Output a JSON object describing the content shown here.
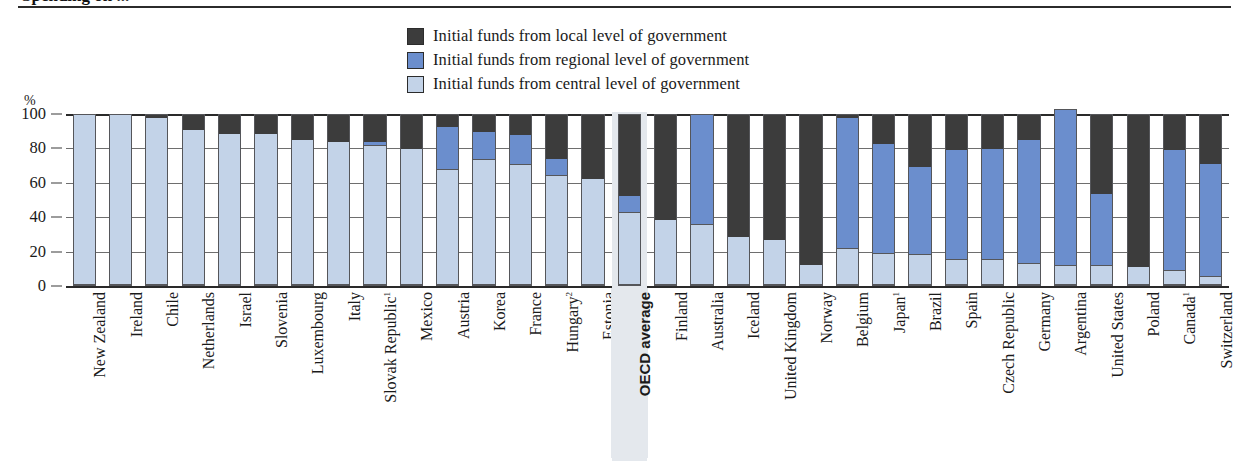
{
  "title_partial": "Spending on ...",
  "axis": {
    "y_unit": "%",
    "yticks": [
      0,
      20,
      40,
      60,
      80,
      100
    ],
    "ylim": [
      0,
      100
    ]
  },
  "legend": {
    "position": "top-center",
    "items": [
      {
        "label": "Initial funds from local level of government",
        "color": "#3c3c3c",
        "key": "local"
      },
      {
        "label": "Initial funds from regional level of government",
        "color": "#6b8ecd",
        "key": "regional"
      },
      {
        "label": "Initial funds from central level of government",
        "color": "#c3d3e8",
        "key": "central"
      }
    ]
  },
  "highlight": {
    "category": "OECD average",
    "color": "#e4e8ed"
  },
  "chart_data": {
    "type": "bar",
    "stacked": true,
    "title": "Spending on ...",
    "xlabel": "",
    "ylabel": "%",
    "ylim": [
      0,
      100
    ],
    "grid": true,
    "legend_position": "top-center",
    "categories": [
      "New Zealand",
      "Ireland",
      "Chile",
      "Netherlands",
      "Israel",
      "Slovenia",
      "Luxembourg",
      "Italy",
      "Slovak Republic¹",
      "Mexico",
      "Austria",
      "Korea",
      "France",
      "Hungary²",
      "Estonia",
      "OECD average",
      "Finland",
      "Australia",
      "Iceland",
      "United Kingdom",
      "Norway",
      "Belgium",
      "Japan¹",
      "Brazil",
      "Spain",
      "Czech Republic",
      "Germany",
      "Argentina",
      "United States",
      "Poland",
      "Canada¹",
      "Switzerland"
    ],
    "series": [
      {
        "name": "Initial funds from central level of government",
        "key": "central",
        "color": "#c3d3e8",
        "values": [
          100,
          100,
          98,
          91,
          89,
          89,
          85,
          84,
          82,
          80,
          68,
          74,
          71,
          64,
          62,
          42,
          38,
          35,
          28,
          26,
          11,
          21,
          18,
          17,
          14,
          14,
          12,
          11,
          11,
          10,
          8,
          4
        ]
      },
      {
        "name": "Initial funds from regional level of government",
        "key": "regional",
        "color": "#6b8ecd",
        "values": [
          0,
          0,
          0,
          0,
          0,
          0,
          0,
          0,
          2,
          0,
          25,
          16,
          17,
          10,
          0,
          10,
          0,
          65,
          0,
          0,
          0,
          77,
          65,
          52,
          65,
          66,
          73,
          92,
          42,
          0,
          71,
          67
        ]
      },
      {
        "name": "Initial funds from local level of government",
        "key": "local",
        "color": "#3c3c3c",
        "values": [
          0,
          0,
          2,
          9,
          11,
          11,
          15,
          16,
          16,
          20,
          7,
          10,
          12,
          26,
          38,
          48,
          62,
          0,
          72,
          74,
          89,
          2,
          17,
          31,
          21,
          20,
          15,
          0,
          47,
          90,
          21,
          29
        ]
      }
    ]
  }
}
